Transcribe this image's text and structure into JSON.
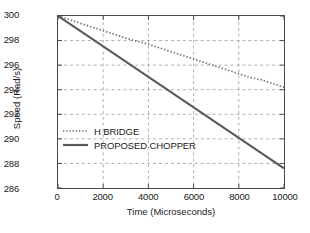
{
  "chart_data": {
    "type": "line",
    "title": "",
    "xlabel": "Time (Microseconds)",
    "ylabel": "Speed (Rad/s)",
    "xlim": [
      0,
      10000
    ],
    "ylim": [
      286,
      300
    ],
    "xticks": [
      0,
      2000,
      4000,
      6000,
      8000,
      10000
    ],
    "xtick_labels": [
      "0",
      "2000",
      "4000",
      "6000",
      "8000",
      "10000"
    ],
    "yticks": [
      286,
      288,
      290,
      292,
      294,
      296,
      298,
      300
    ],
    "ytick_labels": [
      "286",
      "288",
      "290",
      "292",
      "294",
      "296",
      "298",
      "300"
    ],
    "grid": true,
    "grid_style": "dashed",
    "legend_position": "center-left",
    "series": [
      {
        "name": "H BRIDGE",
        "style": "dotted",
        "color": "#6b6b6b",
        "x": [
          0,
          500,
          1000,
          1500,
          2000,
          2500,
          3000,
          3500,
          4000,
          4500,
          5000,
          5500,
          6000,
          6500,
          7000,
          7500,
          8000,
          8500,
          9000,
          9500,
          10000
        ],
        "y": [
          300.0,
          299.7,
          299.4,
          299.1,
          298.8,
          298.5,
          298.2,
          297.95,
          297.7,
          297.4,
          297.1,
          296.8,
          296.5,
          296.2,
          295.9,
          295.6,
          295.3,
          295.0,
          294.8,
          294.5,
          294.2
        ]
      },
      {
        "name": "PROPOSED CHOPPER",
        "style": "solid",
        "color": "#5a5a5a",
        "x": [
          0,
          1000,
          2000,
          3000,
          4000,
          5000,
          6000,
          7000,
          8000,
          9000,
          10000
        ],
        "y": [
          300.0,
          298.76,
          297.52,
          296.28,
          295.04,
          293.8,
          292.56,
          291.32,
          290.08,
          288.84,
          287.6
        ]
      }
    ]
  },
  "legend": {
    "entries": [
      {
        "label": "H BRIDGE",
        "style": "dotted"
      },
      {
        "label": "PROPOSED CHOPPER",
        "style": "solid"
      }
    ]
  },
  "colors": {
    "axis": "#4a4a4a",
    "grid": "#9a9a9a",
    "text": "#1a1a1a",
    "series_dotted": "#6b6b6b",
    "series_solid": "#5a5a5a",
    "background": "#ffffff"
  }
}
